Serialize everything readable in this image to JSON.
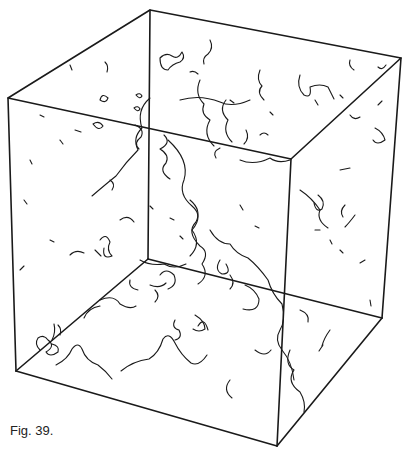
{
  "figure": {
    "caption": "Fig. 39.",
    "stroke_color": "#1a1a1a",
    "background": "#ffffff"
  }
}
